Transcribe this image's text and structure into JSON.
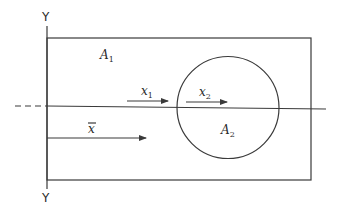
{
  "diagram": {
    "axis": {
      "top_label": "Y",
      "bottom_label": "Y"
    },
    "regions": {
      "rectangle": {
        "label_main": "A",
        "label_sub": "1"
      },
      "circle": {
        "label_main": "A",
        "label_sub": "2"
      }
    },
    "vectors": [
      {
        "name": "x1",
        "label_main": "x",
        "label_sub": "1"
      },
      {
        "name": "x2",
        "label_main": "x",
        "label_sub": "2"
      },
      {
        "name": "xbar",
        "label_main": "x",
        "label_overline": true
      }
    ],
    "colors": {
      "line": "#3a3a3a",
      "background": "#ffffff"
    }
  }
}
